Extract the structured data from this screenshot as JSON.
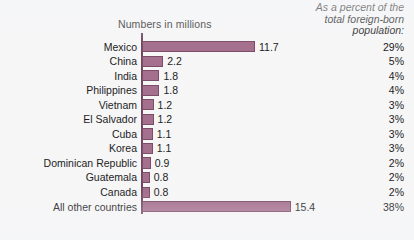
{
  "colors": {
    "bar_fill": "#a5708d",
    "bar_border": "#7c4d68",
    "axis": "#6f4860",
    "background": "#f6f6f7",
    "text": "#1d1d1d"
  },
  "header": {
    "chart_title": "Numbers in millions",
    "percent_header_line1": "As a percent of the",
    "percent_header_line2": "total foreign-born",
    "percent_header_line3": "population:"
  },
  "chart_data": {
    "type": "bar",
    "orientation": "horizontal",
    "title": "Numbers in millions",
    "xlabel": "",
    "ylabel": "",
    "xlim": [
      0,
      16
    ],
    "grid": false,
    "legend": "none",
    "categories": [
      "Mexico",
      "China",
      "India",
      "Philippines",
      "Vietnam",
      "El Salvador",
      "Cuba",
      "Korea",
      "Dominican Republic",
      "Guatemala",
      "Canada",
      "All other countries"
    ],
    "values": [
      11.7,
      2.2,
      1.8,
      1.8,
      1.2,
      1.2,
      1.1,
      1.1,
      0.9,
      0.8,
      0.8,
      15.4
    ],
    "value_labels": [
      "11.7",
      "2.2",
      "1.8",
      "1.8",
      "1.2",
      "1.2",
      "1.1",
      "1.1",
      "0.9",
      "0.8",
      "0.8",
      "15.4"
    ],
    "percent_labels": [
      "29%",
      "5%",
      "4%",
      "4%",
      "3%",
      "3%",
      "3%",
      "3%",
      "2%",
      "2%",
      "2%",
      "38%"
    ],
    "annotations": {
      "secondary_axis_title": "As a percent of the total foreign-born population:"
    }
  },
  "rows": [
    {
      "label": "Mexico",
      "value": 11.7,
      "value_label": "11.7",
      "percent": "29%"
    },
    {
      "label": "China",
      "value": 2.2,
      "value_label": "2.2",
      "percent": "5%"
    },
    {
      "label": "India",
      "value": 1.8,
      "value_label": "1.8",
      "percent": "4%"
    },
    {
      "label": "Philippines",
      "value": 1.8,
      "value_label": "1.8",
      "percent": "4%"
    },
    {
      "label": "Vietnam",
      "value": 1.2,
      "value_label": "1.2",
      "percent": "3%"
    },
    {
      "label": "El Salvador",
      "value": 1.2,
      "value_label": "1.2",
      "percent": "3%"
    },
    {
      "label": "Cuba",
      "value": 1.1,
      "value_label": "1.1",
      "percent": "3%"
    },
    {
      "label": "Korea",
      "value": 1.1,
      "value_label": "1.1",
      "percent": "3%"
    },
    {
      "label": "Dominican Republic",
      "value": 0.9,
      "value_label": "0.9",
      "percent": "2%"
    },
    {
      "label": "Guatemala",
      "value": 0.8,
      "value_label": "0.8",
      "percent": "2%"
    },
    {
      "label": "Canada",
      "value": 0.8,
      "value_label": "0.8",
      "percent": "2%"
    },
    {
      "label": "All other countries",
      "value": 15.4,
      "value_label": "15.4",
      "percent": "38%"
    }
  ],
  "scale": {
    "pixels_per_million": 9.66,
    "row_height": 14.55,
    "first_row_top": 6.5
  }
}
